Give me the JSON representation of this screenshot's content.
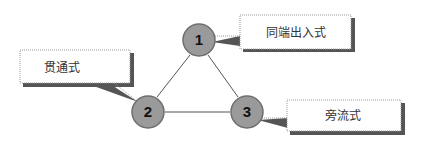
{
  "diagram": {
    "nodes": [
      {
        "id": "1",
        "label": "1",
        "cx": 199,
        "cy": 40
      },
      {
        "id": "2",
        "label": "2",
        "cx": 148,
        "cy": 112
      },
      {
        "id": "3",
        "label": "3",
        "cx": 247,
        "cy": 112
      }
    ],
    "edges": [
      [
        "1",
        "2"
      ],
      [
        "1",
        "3"
      ],
      [
        "2",
        "3"
      ]
    ],
    "callouts": [
      {
        "node": "1",
        "text": "同端出入式"
      },
      {
        "node": "2",
        "text": "贯通式"
      },
      {
        "node": "3",
        "text": "旁流式"
      }
    ],
    "colors": {
      "node_fill": "#9a9a9a",
      "node_stroke": "#6e6e6e",
      "edge": "#555555",
      "callout_shadow": "#555555",
      "callout_border": "#999999"
    }
  }
}
